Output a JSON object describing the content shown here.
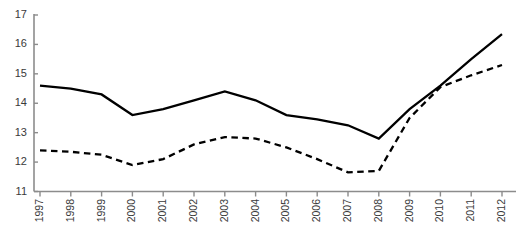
{
  "chart_data": {
    "type": "line",
    "title": "",
    "subtitle": "",
    "xlabel": "",
    "ylabel": "",
    "categories": [
      "1997",
      "1998",
      "1999",
      "2000",
      "2001",
      "2002",
      "2003",
      "2004",
      "2005",
      "2006",
      "2007",
      "2008",
      "2009",
      "2010",
      "2011",
      "2012"
    ],
    "x": [
      1997,
      1998,
      1999,
      2000,
      2001,
      2002,
      2003,
      2004,
      2005,
      2006,
      2007,
      2008,
      2009,
      2010,
      2011,
      2012
    ],
    "series": [
      {
        "name": "series-solid",
        "style": "solid",
        "color": "#000000",
        "values": [
          14.6,
          14.5,
          14.3,
          13.6,
          13.8,
          14.1,
          14.4,
          14.1,
          13.6,
          13.45,
          13.25,
          12.8,
          13.8,
          14.6,
          15.5,
          16.35
        ]
      },
      {
        "name": "series-dashed",
        "style": "dashed",
        "color": "#000000",
        "values": [
          12.4,
          12.35,
          12.25,
          11.9,
          12.1,
          12.6,
          12.85,
          12.8,
          12.5,
          12.1,
          11.65,
          11.7,
          13.5,
          14.55,
          14.95,
          15.3
        ]
      }
    ],
    "ylim": [
      11,
      17
    ],
    "xlim": [
      1997,
      2012
    ],
    "yticks": [
      11,
      12,
      13,
      14,
      15,
      16,
      17
    ],
    "ytick_labels": [
      "11",
      "12",
      "13",
      "14",
      "15",
      "16",
      "17"
    ],
    "xtick_labels": [
      "1997",
      "1998",
      "1999",
      "2000",
      "2001",
      "2002",
      "2003",
      "2004",
      "2005",
      "2006",
      "2007",
      "2008",
      "2009",
      "2010",
      "2011",
      "2012"
    ],
    "grid": false,
    "legend": "none",
    "axis_color": "#8c8c8c",
    "tick_color": "#8c8c8c",
    "label_color": "#3a3a3a",
    "background": "#ffffff"
  }
}
